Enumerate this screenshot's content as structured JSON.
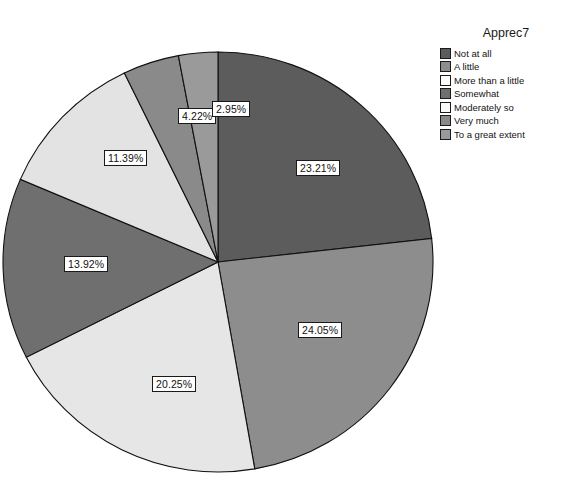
{
  "chart_data": {
    "type": "pie",
    "title": "Apprec7",
    "xlabel": "",
    "ylabel": "",
    "legend_position": "right",
    "grid": false,
    "start_angle_deg": 0,
    "direction": "clockwise",
    "categories": [
      "Not at all",
      "A little",
      "More than a little",
      "Somewhat",
      "Moderately so",
      "Very much",
      "To a great extent"
    ],
    "values": [
      23.21,
      24.05,
      20.25,
      13.92,
      11.39,
      4.22,
      2.95
    ],
    "labels": [
      "23.21%",
      "24.05%",
      "20.25%",
      "13.92%",
      "11.39%",
      "4.22%",
      "2.95%"
    ],
    "colors": [
      "#5c5c5c",
      "#8d8d8d",
      "#e6e6e6",
      "#6f6f6f",
      "#e3e3e3",
      "#8a8a8a",
      "#9a9a9a"
    ],
    "slices": [
      {
        "name": "Not at all",
        "value": 23.21,
        "label": "23.21%",
        "color": "#5c5c5c",
        "label_x": 296,
        "label_y": 160
      },
      {
        "name": "A little",
        "value": 24.05,
        "label": "24.05%",
        "color": "#8d8d8d",
        "label_x": 298,
        "label_y": 322
      },
      {
        "name": "More than a little",
        "value": 20.25,
        "label": "20.25%",
        "color": "#e6e6e6",
        "label_x": 152,
        "label_y": 376
      },
      {
        "name": "Somewhat",
        "value": 13.92,
        "label": "13.92%",
        "color": "#6f6f6f",
        "label_x": 64,
        "label_y": 256
      },
      {
        "name": "Moderately so",
        "value": 11.39,
        "label": "11.39%",
        "color": "#e3e3e3",
        "label_x": 104,
        "label_y": 150
      },
      {
        "name": "Very much",
        "value": 4.22,
        "label": "4.22%",
        "color": "#8a8a8a",
        "label_x": 178,
        "label_y": 108
      },
      {
        "name": "To a great extent",
        "value": 2.95,
        "label": "2.95%",
        "color": "#9a9a9a",
        "label_x": 212,
        "label_y": 101
      }
    ],
    "geometry": {
      "cx": 218,
      "cy": 262,
      "rx": 215,
      "ry": 210
    }
  },
  "legend": {
    "title": "Apprec7",
    "items": [
      {
        "label": "Not at all",
        "color": "#5c5c5c"
      },
      {
        "label": "A little",
        "color": "#8d8d8d"
      },
      {
        "label": "More than a little",
        "color": "#fdfdfd"
      },
      {
        "label": "Somewhat",
        "color": "#6f6f6f"
      },
      {
        "label": "Moderately so",
        "color": "#fafafa"
      },
      {
        "label": "Very much",
        "color": "#8a8a8a"
      },
      {
        "label": "To a great extent",
        "color": "#9a9a9a"
      }
    ]
  }
}
